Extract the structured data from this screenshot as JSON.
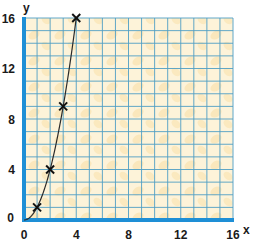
{
  "chart_data": {
    "type": "line",
    "title": "",
    "xlabel": "x",
    "ylabel": "y",
    "xlim": [
      0,
      16
    ],
    "ylim": [
      0,
      16
    ],
    "x_ticks": [
      0,
      4,
      8,
      12,
      16
    ],
    "y_ticks": [
      0,
      4,
      8,
      12,
      16
    ],
    "grid": true,
    "grid_step": 1,
    "legend": null,
    "series": [
      {
        "name": "y = x^2",
        "curve": "smooth",
        "markers": "x",
        "x": [
          1,
          2,
          3,
          4
        ],
        "y": [
          1,
          4,
          9,
          16
        ]
      }
    ],
    "curve_starts_at": [
      0,
      0
    ]
  },
  "colors": {
    "axis": "#1e8fd6",
    "grid": "#4f9ec4",
    "background": "#fdf3d9",
    "background_blotch": "#f9dfa9",
    "curve": "#2a2a2a",
    "marker": "#111111",
    "text": "#1a1a1a"
  },
  "labels": {
    "x_axis": "x",
    "y_axis": "y",
    "x_ticks": [
      "0",
      "4",
      "8",
      "12",
      "16"
    ],
    "y_ticks": [
      "0",
      "4",
      "8",
      "12",
      "16"
    ]
  }
}
